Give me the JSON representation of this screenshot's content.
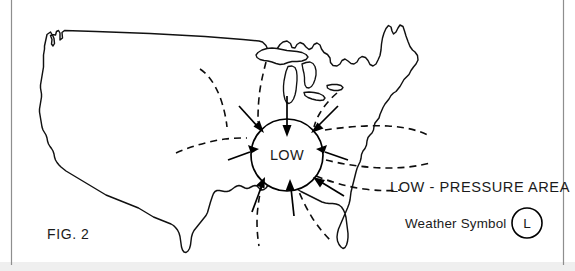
{
  "figure": {
    "caption": "FIG. 2",
    "center_label": "LOW",
    "legend_title": "LOW - PRESSURE AREA",
    "legend_symbol_label": "Weather Symbol",
    "legend_symbol_glyph": "L",
    "title_hidden": "Low-pressure area weather map of the contiguous United States",
    "colors": {
      "background": "#ffffff",
      "line": "#111111",
      "isobar": "#0d0d0d",
      "text": "#1b1b1b",
      "frame_rule": "#8e8e8e",
      "bottom_band": "#efefef"
    },
    "map": {
      "region_name": "contiguous-united-states",
      "features": [
        "pacific-coast",
        "canadian-border",
        "great-lakes",
        "new-england-coast",
        "atlantic-coast",
        "florida-peninsula",
        "gulf-coast",
        "mexican-border"
      ]
    },
    "pressure_system": {
      "type": "low",
      "circulation": "converging-inflow",
      "isobar_count": 4,
      "inflow_arrow_count": 8,
      "inflow_directions": [
        "north",
        "northeast",
        "east",
        "southeast",
        "south",
        "southwest",
        "west",
        "northwest"
      ]
    }
  }
}
